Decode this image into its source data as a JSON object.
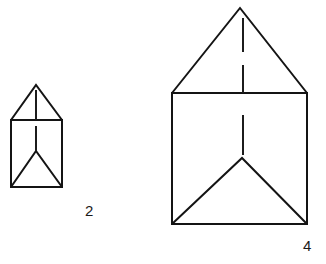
{
  "figure": {
    "title": "",
    "background_color": "#ffffff",
    "stroke_color": "#141414",
    "label_color": "#1a1a1a",
    "items": [
      {
        "id": "small-house",
        "label": "2",
        "label_x": 85,
        "label_y": 203,
        "square": {
          "left": 11,
          "top": 120,
          "right": 62,
          "bottom": 187
        },
        "roof_apex": {
          "x": 36,
          "y": 85
        },
        "inner_v_apex": {
          "x": 36,
          "y": 151
        },
        "ticks": [
          {
            "x": 36,
            "y1": 90,
            "y2": 120
          },
          {
            "x": 36,
            "y1": 126,
            "y2": 151
          }
        ]
      },
      {
        "id": "large-house",
        "label": "4",
        "label_x": 303,
        "label_y": 238,
        "square": {
          "left": 172,
          "top": 93,
          "right": 307,
          "bottom": 224
        },
        "roof_apex": {
          "x": 240,
          "y": 8
        },
        "inner_v_apex": {
          "x": 242,
          "y": 158
        },
        "ticks": [
          {
            "x": 243,
            "y1": 18,
            "y2": 52
          },
          {
            "x": 243,
            "y1": 65,
            "y2": 93
          },
          {
            "x": 243,
            "y1": 115,
            "y2": 155
          }
        ]
      }
    ]
  }
}
